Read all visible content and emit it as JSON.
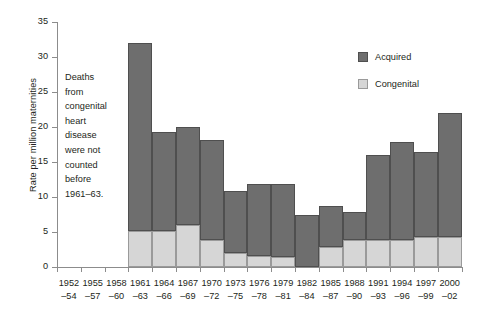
{
  "chart_data": {
    "type": "bar",
    "stacked": true,
    "title": "",
    "xlabel": "",
    "ylabel": "Rate per million maternities",
    "ylim": [
      0,
      35
    ],
    "yticks": [
      0,
      5,
      10,
      15,
      20,
      25,
      30,
      35
    ],
    "grid": false,
    "legend_position": "top-right",
    "categories": [
      "1952–54",
      "1955–57",
      "1958–60",
      "1961–63",
      "1964–66",
      "1967–69",
      "1970–72",
      "1973–75",
      "1976–78",
      "1979–81",
      "1982–84",
      "1985–87",
      "1988–90",
      "1991–93",
      "1994–96",
      "1997–99",
      "2000–02"
    ],
    "category_lines": [
      [
        "1952",
        "–54"
      ],
      [
        "1955",
        "–57"
      ],
      [
        "1958",
        "–60"
      ],
      [
        "1961",
        "–63"
      ],
      [
        "1964",
        "–66"
      ],
      [
        "1967",
        "–69"
      ],
      [
        "1970",
        "–72"
      ],
      [
        "1973",
        "–75"
      ],
      [
        "1976",
        "–78"
      ],
      [
        "1979",
        "–81"
      ],
      [
        "1982",
        "–84"
      ],
      [
        "1985",
        "–87"
      ],
      [
        "1988",
        "–90"
      ],
      [
        "1991",
        "–93"
      ],
      [
        "1994",
        "–96"
      ],
      [
        "1997",
        "–99"
      ],
      [
        "2000",
        "–02"
      ]
    ],
    "series": [
      {
        "name": "Congenital",
        "color": "#d6d6d6",
        "values": [
          null,
          null,
          null,
          5.2,
          5.2,
          6.0,
          3.9,
          2.0,
          1.6,
          1.4,
          0.0,
          2.8,
          3.8,
          3.9,
          3.9,
          4.3,
          4.3
        ]
      },
      {
        "name": "Acquired",
        "color": "#6e6e6e",
        "values": [
          null,
          null,
          null,
          26.8,
          14.1,
          14.0,
          14.2,
          8.8,
          10.2,
          10.5,
          7.5,
          5.9,
          4.0,
          12.1,
          13.9,
          12.2,
          17.7
        ]
      }
    ],
    "totals": [
      null,
      null,
      null,
      32.0,
      19.3,
      20.0,
      18.1,
      10.8,
      11.8,
      11.9,
      7.5,
      8.7,
      7.8,
      16.0,
      17.8,
      16.5,
      22.0
    ],
    "annotation": {
      "lines": [
        "Deaths",
        "from",
        "congenital",
        "heart",
        "disease",
        "were not",
        "counted",
        "before",
        "1961–63."
      ]
    }
  },
  "legend": {
    "items": [
      {
        "label": "Acquired",
        "swatch": "acquired"
      },
      {
        "label": "Congenital",
        "swatch": "congenital"
      }
    ]
  }
}
